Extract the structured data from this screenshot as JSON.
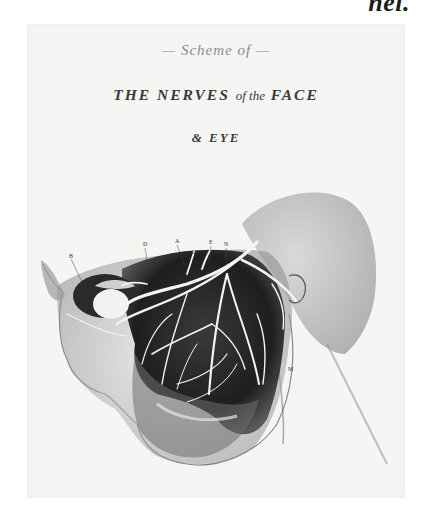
{
  "page": {
    "caption_fragment": "nel."
  },
  "plate": {
    "title_top": "— Scheme of —",
    "title_main_part1": "THE NERVES",
    "title_main_part2": "of the",
    "title_main_part3": "FACE",
    "title_sub": "& EYE",
    "background_color": "#f5f5f4",
    "ink_color": "#2a2a2a"
  },
  "illustration": {
    "subject": "Anatomical engraving of nerves of the face and eye, left profile",
    "labels": [
      {
        "text": "B",
        "x": 42,
        "y": 232
      },
      {
        "text": "D",
        "x": 116,
        "y": 220
      },
      {
        "text": "A",
        "x": 148,
        "y": 217
      },
      {
        "text": "E",
        "x": 182,
        "y": 218
      },
      {
        "text": "N",
        "x": 197,
        "y": 220
      },
      {
        "text": "2",
        "x": 166,
        "y": 228
      },
      {
        "text": "3",
        "x": 181,
        "y": 233
      },
      {
        "text": "4",
        "x": 196,
        "y": 233
      },
      {
        "text": "M",
        "x": 261,
        "y": 345
      }
    ]
  }
}
